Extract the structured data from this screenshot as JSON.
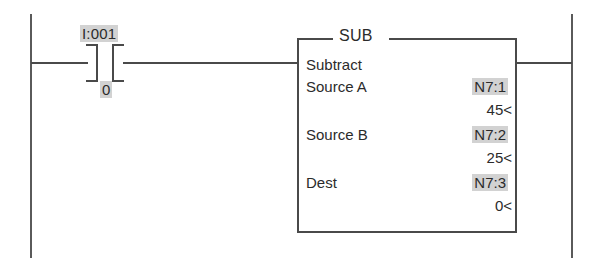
{
  "rung": {
    "contact": {
      "type": "xic-normally-open-contact",
      "address": "I:001",
      "bit": "0"
    },
    "instruction": {
      "mnemonic": "SUB",
      "name": "Subtract",
      "parameters": [
        {
          "label": "Source A",
          "address": "N7:1",
          "value": "45<"
        },
        {
          "label": "Source B",
          "address": "N7:2",
          "value": "25<"
        },
        {
          "label": "Dest",
          "address": "N7:3",
          "value": "0<"
        }
      ]
    }
  },
  "colors": {
    "line": "#4a4a4a",
    "rail": "#5a5a5a",
    "highlight": "#d2d2d2",
    "text": "#2b2b2b",
    "background": "#ffffff"
  }
}
